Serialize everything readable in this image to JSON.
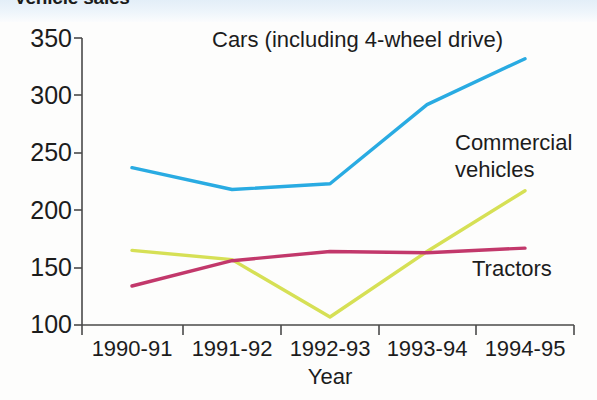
{
  "title": "Vehicle sales",
  "axis": {
    "x_title": "Year",
    "y_ticks": [
      "350",
      "300",
      "250",
      "200",
      "150",
      "100"
    ],
    "x_ticks": [
      "1990-91",
      "1991-92",
      "1992-93",
      "1993-94",
      "1994-95"
    ]
  },
  "labels": {
    "cars": "Cars (including 4-wheel drive)",
    "commercial_line1": "Commercial",
    "commercial_line2": "vehicles",
    "tractors": "Tractors"
  },
  "colors": {
    "cars": "#29ABE2",
    "commercial": "#D6E055",
    "tractors": "#C2386B",
    "axis": "#4a4a4a",
    "text": "#1c1c1c",
    "background": "#fdfdfc"
  },
  "chart_data": {
    "type": "line",
    "title": "Vehicle sales",
    "xlabel": "Year",
    "ylabel": "",
    "categories": [
      "1990-91",
      "1991-92",
      "1992-93",
      "1993-94",
      "1994-95"
    ],
    "ylim": [
      100,
      350
    ],
    "yticks": [
      100,
      150,
      200,
      250,
      300,
      350
    ],
    "grid": false,
    "legend": "inline-annotations",
    "series": [
      {
        "name": "Cars (including 4-wheel drive)",
        "color": "#29ABE2",
        "values": [
          237,
          218,
          223,
          292,
          332
        ]
      },
      {
        "name": "Commercial vehicles",
        "color": "#D6E055",
        "values": [
          165,
          157,
          107,
          164,
          217
        ]
      },
      {
        "name": "Tractors",
        "color": "#C2386B",
        "values": [
          134,
          156,
          164,
          163,
          167
        ]
      }
    ]
  }
}
